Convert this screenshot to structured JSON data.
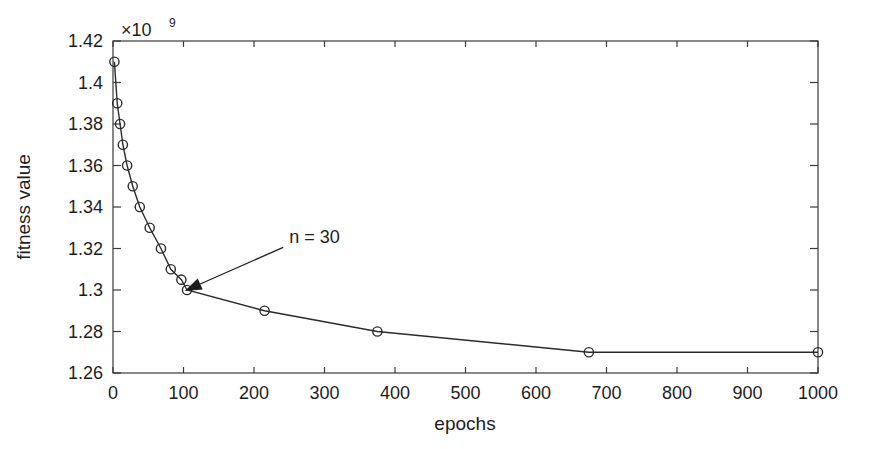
{
  "chart_data": {
    "type": "line",
    "title": "",
    "xlabel": "epochs",
    "ylabel": "fitness value",
    "y_exponent_label": "×10",
    "y_exponent_power": "9",
    "xlim": [
      0,
      1000
    ],
    "ylim": [
      1.26,
      1.42
    ],
    "xticks": [
      0,
      100,
      200,
      300,
      400,
      500,
      600,
      700,
      800,
      900,
      1000
    ],
    "xtick_labels": [
      "0",
      "100",
      "200",
      "300",
      "400",
      "500",
      "600",
      "700",
      "800",
      "900",
      "1000"
    ],
    "yticks": [
      1.26,
      1.28,
      1.3,
      1.32,
      1.34,
      1.36,
      1.38,
      1.4,
      1.42
    ],
    "ytick_labels": [
      "1.26",
      "1.28",
      "1.3",
      "1.32",
      "1.34",
      "1.36",
      "1.38",
      "1.4",
      "1.42"
    ],
    "grid": false,
    "legend": null,
    "marker": "circle-open",
    "line_color": "#2b2b2b",
    "x": [
      2,
      6,
      10,
      14,
      20,
      28,
      38,
      52,
      68,
      82,
      97,
      105,
      215,
      375,
      675,
      1000
    ],
    "y": [
      1.41,
      1.39,
      1.38,
      1.37,
      1.36,
      1.35,
      1.34,
      1.33,
      1.32,
      1.31,
      1.305,
      1.3,
      1.29,
      1.28,
      1.27,
      1.27
    ],
    "series": [
      {
        "name": "fitness value",
        "x": [
          2,
          6,
          10,
          14,
          20,
          28,
          38,
          52,
          68,
          82,
          97,
          105,
          215,
          375,
          675,
          1000
        ],
        "values": [
          1.41,
          1.39,
          1.38,
          1.37,
          1.36,
          1.35,
          1.34,
          1.33,
          1.32,
          1.31,
          1.305,
          1.3,
          1.29,
          1.28,
          1.27,
          1.27
        ]
      }
    ],
    "annotations": [
      {
        "text": "n = 30",
        "point_x": 105,
        "point_y": 1.3,
        "label_x": 250,
        "label_y": 1.3225
      }
    ]
  }
}
